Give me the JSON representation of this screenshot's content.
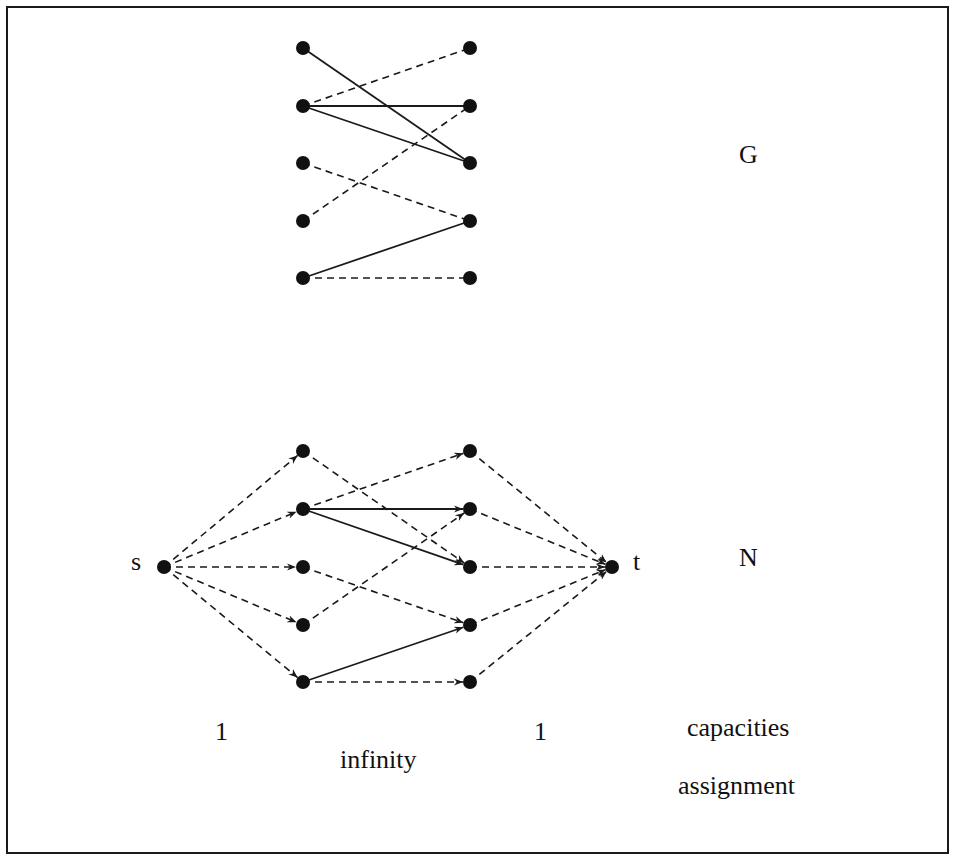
{
  "figure": {
    "colors": {
      "stroke": "#1a1a1a",
      "node": "#111111",
      "background": "#ffffff"
    }
  },
  "graph_G": {
    "label": "G",
    "left_nodes": [
      "L1",
      "L2",
      "L3",
      "L4",
      "L5"
    ],
    "right_nodes": [
      "R1",
      "R2",
      "R3",
      "R4",
      "R5"
    ],
    "edges": [
      {
        "from": "L1",
        "to": "R3",
        "style": "solid"
      },
      {
        "from": "L2",
        "to": "R1",
        "style": "dashed"
      },
      {
        "from": "L2",
        "to": "R2",
        "style": "solid"
      },
      {
        "from": "L2",
        "to": "R3",
        "style": "solid"
      },
      {
        "from": "L3",
        "to": "R4",
        "style": "dashed"
      },
      {
        "from": "L4",
        "to": "R2",
        "style": "dashed"
      },
      {
        "from": "L5",
        "to": "R4",
        "style": "solid"
      },
      {
        "from": "L5",
        "to": "R5",
        "style": "dashed"
      }
    ]
  },
  "network_N": {
    "label": "N",
    "source_label": "s",
    "sink_label": "t",
    "source_edges_style": "dashed",
    "sink_edges_style": "dashed",
    "middle_edges": [
      {
        "from": "L1",
        "to": "R3",
        "style": "dashed"
      },
      {
        "from": "L2",
        "to": "R1",
        "style": "dashed"
      },
      {
        "from": "L2",
        "to": "R2",
        "style": "solid"
      },
      {
        "from": "L2",
        "to": "R3",
        "style": "solid"
      },
      {
        "from": "L3",
        "to": "R4",
        "style": "dashed"
      },
      {
        "from": "L4",
        "to": "R2",
        "style": "dashed"
      },
      {
        "from": "L5",
        "to": "R4",
        "style": "solid"
      },
      {
        "from": "L5",
        "to": "R5",
        "style": "dashed"
      }
    ]
  },
  "capacities": {
    "source_to_left": "1",
    "left_to_right": "infinity",
    "right_to_sink": "1",
    "caption_line1": "capacities",
    "caption_line2": "assignment"
  }
}
